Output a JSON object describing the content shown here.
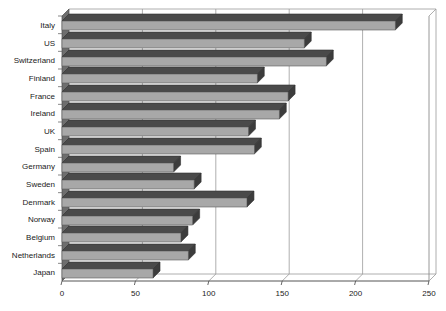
{
  "chart_data": {
    "type": "bar",
    "orientation": "horizontal",
    "style": "3d-bar",
    "title": "",
    "subtitle": "",
    "xlabel": "",
    "ylabel": "",
    "categories": [
      "Italy",
      "US",
      "Switzerland",
      "Finland",
      "France",
      "Ireland",
      "UK",
      "Spain",
      "Germany",
      "Sweden",
      "Denmark",
      "Norway",
      "Belgium",
      "Netherlands",
      "Japan"
    ],
    "values": [
      227,
      165,
      180,
      133,
      154,
      148,
      127,
      131,
      76,
      90,
      126,
      89,
      81,
      86,
      62
    ],
    "series": [
      {
        "name": "",
        "values": [
          227,
          165,
          180,
          133,
          154,
          148,
          127,
          131,
          76,
          90,
          126,
          89,
          81,
          86,
          62
        ]
      }
    ],
    "xlim": [
      0,
      250
    ],
    "ylim": [
      0,
      15
    ],
    "xticks": [
      0,
      50,
      100,
      150,
      200,
      250
    ],
    "xtick_labels": [
      "0",
      "50",
      "100",
      "150",
      "200",
      "250"
    ],
    "grid": true,
    "grid_axis": "x",
    "legend": false,
    "legend_position": "none",
    "annotations": [],
    "colors": {
      "bar_face": "#a8a8a8",
      "bar_top": "#4a4a4a",
      "bar_side": "#3c3c3c",
      "axis": "#555555",
      "grid": "#9a9a9a",
      "plot_border": "#8c8c8c",
      "text": "#1a1a1a",
      "background": "#ffffff"
    }
  },
  "axes": {
    "x_axis_name": "x-axis",
    "y_axis_name": "y-axis-categories"
  }
}
